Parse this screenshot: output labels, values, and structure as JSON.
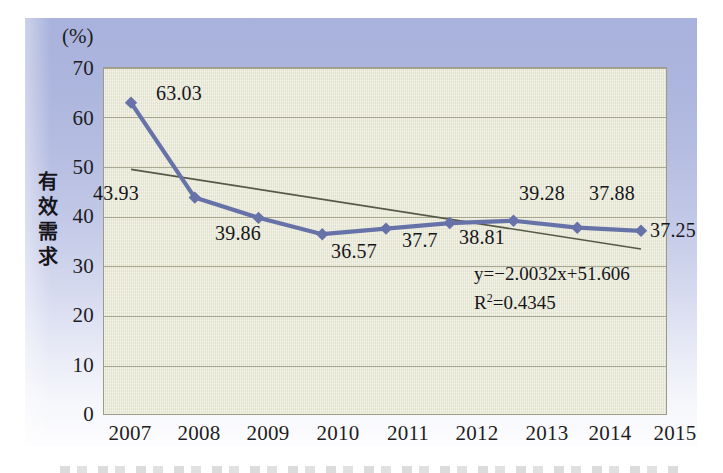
{
  "chart_data": {
    "type": "line",
    "title": "",
    "unit_label": "(%)",
    "ylabel": "有效需求",
    "xlabel": "",
    "categories": [
      "2007",
      "2008",
      "2009",
      "2010",
      "2011",
      "2012",
      "2013",
      "2014",
      "2015"
    ],
    "values": [
      63.03,
      43.93,
      39.86,
      36.57,
      37.7,
      38.81,
      39.28,
      37.88,
      37.25
    ],
    "point_labels": [
      "63.03",
      "43.93",
      "39.86",
      "36.57",
      "37.7",
      "38.81",
      "39.28",
      "37.88",
      "37.25"
    ],
    "ylim": [
      0,
      70
    ],
    "yticks": [
      "0",
      "10",
      "20",
      "30",
      "40",
      "50",
      "60",
      "70"
    ],
    "grid": true,
    "legend": "none",
    "series": [
      {
        "name": "有效需求",
        "values": [
          63.03,
          43.93,
          39.86,
          36.57,
          37.7,
          38.81,
          39.28,
          37.88,
          37.25
        ],
        "color": "#6773a8",
        "marker": "diamond"
      }
    ],
    "trendline": {
      "equation": "y=−2.0032x+51.606",
      "r_squared": "R²=0.4345",
      "r_squared_label": "R",
      "r_squared_exp": "2",
      "r_squared_value": "=0.4345",
      "slope": -2.0032,
      "intercept": 51.606,
      "color": "#585848"
    },
    "colors": {
      "plot_background": "#e9e9d6",
      "panel_background": "#a8b2dc",
      "gridline": "#9a9a84",
      "series": "#6773a8",
      "trendline": "#585848",
      "text": "#16161b"
    }
  }
}
